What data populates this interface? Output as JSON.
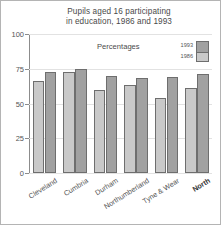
{
  "chart_data": {
    "type": "bar",
    "title": "Pupils aged 16 participating in education, 1986 and 1993",
    "title_lines": [
      "Pupils aged 16 participating",
      "in education, 1986 and 1993"
    ],
    "subtitle": "Percentages",
    "xlabel": "",
    "ylabel": "",
    "ylim": [
      0,
      100
    ],
    "yticks": [
      0,
      25,
      50,
      75,
      100
    ],
    "ytick_labels": [
      "0",
      "25",
      "50",
      "75",
      "100"
    ],
    "grid": true,
    "legend_position": "inside-top-right",
    "categories": [
      "Cleveland",
      "Cumbria",
      "Durham",
      "Northumberland",
      "Tyne & Wear",
      "North"
    ],
    "emphasized_category": "North",
    "series": [
      {
        "name": "1986",
        "color": "#c9c9c9",
        "values": [
          66,
          73,
          60,
          63,
          54,
          61
        ]
      },
      {
        "name": "1993",
        "color": "#a1a1a1",
        "values": [
          73,
          75,
          70,
          68,
          69,
          71
        ]
      }
    ]
  },
  "legend": {
    "title": "Percentages",
    "entries": [
      {
        "label": "1993",
        "color": "#a1a1a1"
      },
      {
        "label": "1986",
        "color": "#c9c9c9"
      }
    ]
  },
  "colors": {
    "axis": "#8c8c8c",
    "grid": "#e2e2e2",
    "text": "#4a4a4a",
    "border": "#b4b4b4",
    "bar_outline": "#6e6e6e"
  }
}
